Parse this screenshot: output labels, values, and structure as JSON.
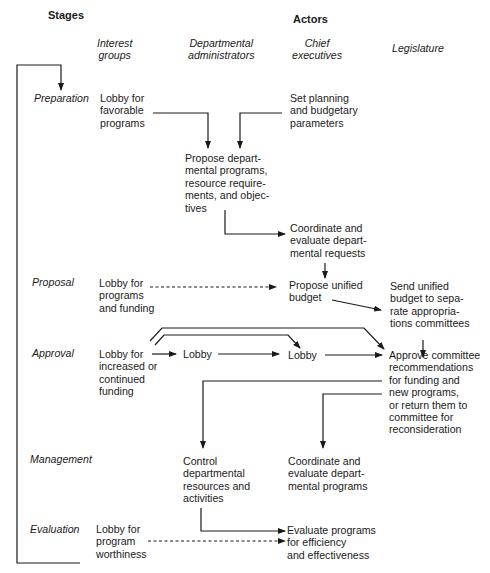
{
  "headers": {
    "stages": "Stages",
    "actors": "Actors"
  },
  "columns": [
    {
      "id": "interest-groups",
      "label": "Interest\ngroups"
    },
    {
      "id": "departmental-administrators",
      "label": "Departmental\nadministrators"
    },
    {
      "id": "chief-executives",
      "label": "Chief\nexecutives"
    },
    {
      "id": "legislature",
      "label": "Legislature"
    }
  ],
  "stages": [
    {
      "id": "preparation",
      "label": "Preparation"
    },
    {
      "id": "proposal",
      "label": "Proposal"
    },
    {
      "id": "approval",
      "label": "Approval"
    },
    {
      "id": "management",
      "label": "Management"
    },
    {
      "id": "evaluation",
      "label": "Evaluation"
    }
  ],
  "nodes": {
    "prep_interest": "Lobby for\nfavorable\nprograms",
    "prep_chief": "Set planning\nand budgetary\nparameters",
    "prep_dept": "Propose depart-\nmental programs,\nresource require-\nments, and objec-\ntives",
    "prep_chief_coord": "Coordinate and\nevaluate depart-\nmental requests",
    "prop_interest": "Lobby for\nprograms\nand funding",
    "prop_chief": "Propose unified\nbudget",
    "prop_legis": "Send unified\nbudget to sepa-\nrate appropria-\ntions committees",
    "appr_interest": "Lobby for\nincreased or\ncontinued\nfunding",
    "appr_dept": "Lobby",
    "appr_chief": "Lobby",
    "appr_legis": "Approve committee\nrecommendations\nfor funding and\nnew programs,\nor return them to\ncommittee for\nreconsideration",
    "mgmt_dept": "Control\ndepartmental\nresources and\nactivities",
    "mgmt_chief": "Coordinate and\nevaluate depart-\nmental programs",
    "eval_interest": "Lobby for\nprogram\nworthiness",
    "eval_chief": "Evaluate programs\nfor efficiency\nand effectiveness"
  }
}
